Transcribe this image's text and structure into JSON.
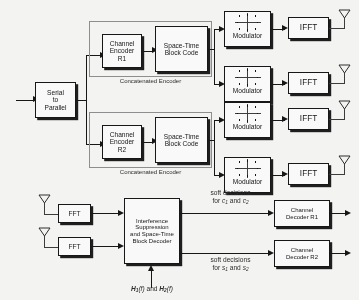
{
  "diagram": {
    "transmitter": {
      "input_block": {
        "line1": "Serial",
        "line2": "to",
        "line3": "Parallel"
      },
      "branches": [
        {
          "group_label": "Concatenated Encoder",
          "channel_encoder": {
            "line1": "Channel",
            "line2": "Encoder",
            "line3": "R1"
          },
          "space_time": {
            "line1": "Space-Time",
            "line2": "Block Code"
          },
          "modulators": [
            {
              "label": "Modulator",
              "icon": "constellation-icon",
              "ifft": "IFFT",
              "antenna": "antenna-icon"
            },
            {
              "label": "Modulator",
              "icon": "constellation-icon",
              "ifft": "IFFT",
              "antenna": "antenna-icon"
            }
          ]
        },
        {
          "group_label": "Concatenated Encoder",
          "channel_encoder": {
            "line1": "Channel",
            "line2": "Encoder",
            "line3": "R2"
          },
          "space_time": {
            "line1": "Space-Time",
            "line2": "Block Code"
          },
          "modulators": [
            {
              "label": "Modulator",
              "icon": "constellation-icon",
              "ifft": "IFFT",
              "antenna": "antenna-icon"
            },
            {
              "label": "Modulator",
              "icon": "constellation-icon",
              "ifft": "IFFT",
              "antenna": "antenna-icon"
            }
          ]
        }
      ]
    },
    "receiver": {
      "fft_blocks": [
        {
          "label": "FFT",
          "antenna": "antenna-icon"
        },
        {
          "label": "FFT",
          "antenna": "antenna-icon"
        }
      ],
      "decoder_block": {
        "line1": "Interference",
        "line2": "Suppression",
        "line3": "and Space-Time",
        "line4": "Block Decoder"
      },
      "channel_estimate_label": {
        "h1": "H",
        "h1_sub": "1",
        "f1": "(f)",
        "conj": "and",
        "h2": "H",
        "h2_sub": "2",
        "f2": "(f)"
      },
      "soft_decision_top": {
        "line1": "soft decisions",
        "prefix": "for",
        "sym1": "c",
        "sym1_sub": "1",
        "joiner": "and",
        "sym2": "c",
        "sym2_sub": "2"
      },
      "soft_decision_bottom": {
        "line1": "soft decisions",
        "prefix": "for",
        "sym1": "s",
        "sym1_sub": "1",
        "joiner": "and",
        "sym2": "s",
        "sym2_sub": "2"
      },
      "channel_decoders": [
        {
          "line1": "Channel",
          "line2": "Decoder R1"
        },
        {
          "line1": "Channel",
          "line2": "Decoder R2"
        }
      ]
    }
  }
}
